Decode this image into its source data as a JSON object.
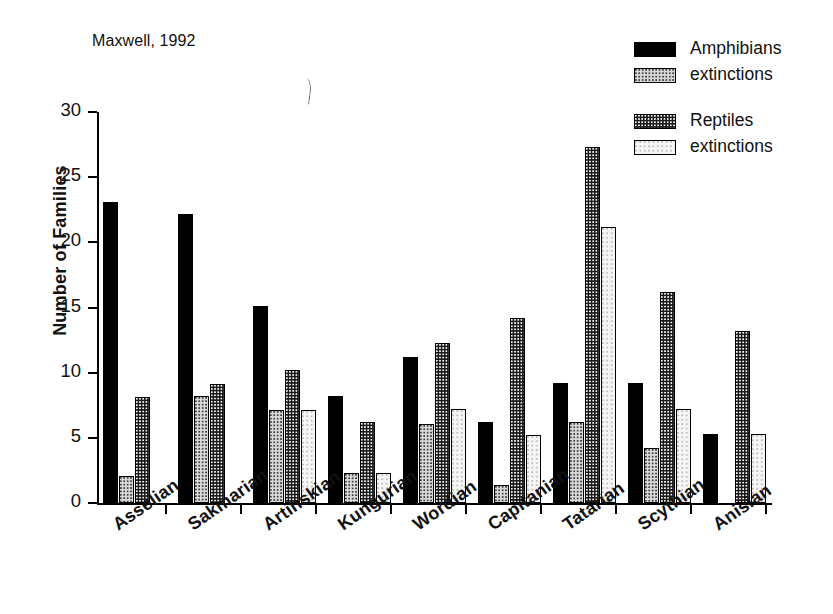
{
  "figure": {
    "source_caption": "Maxwell, 1992",
    "stray_mark_name": "scan-artifact"
  },
  "legend": {
    "groups": [
      {
        "entries": [
          {
            "label": "Amphibians",
            "swatch": "solid",
            "color": "#000000"
          },
          {
            "label": "extinctions",
            "swatch": "light",
            "color": "#d8d8d8"
          }
        ]
      },
      {
        "entries": [
          {
            "label": "Reptiles",
            "swatch": "dark",
            "color": "#1b1b1b"
          },
          {
            "label": "extinctions",
            "swatch": "white",
            "color": "#f5f5f5"
          }
        ]
      }
    ]
  },
  "chart_data": {
    "type": "bar",
    "title": "",
    "annotation": "Maxwell, 1992",
    "xlabel": "",
    "ylabel": "Number of Families",
    "ylim": [
      0,
      30
    ],
    "yticks": [
      0,
      5,
      10,
      15,
      20,
      25,
      30
    ],
    "grid": false,
    "legend_position": "top-right",
    "categories": [
      "Asselian",
      "Sakmarian",
      "Artinskian",
      "Kungurian",
      "Wordian",
      "Capitanian",
      "Tatarian",
      "Scythian",
      "Anisian"
    ],
    "series": [
      {
        "name": "Amphibians",
        "fill": "solid",
        "values": [
          23.1,
          22.2,
          15.1,
          8.2,
          11.2,
          6.2,
          9.2,
          9.2,
          5.3
        ]
      },
      {
        "name": "Amphibian extinctions",
        "fill": "light",
        "values": [
          2.1,
          8.2,
          7.1,
          2.3,
          6.1,
          1.4,
          6.2,
          4.2,
          0
        ]
      },
      {
        "name": "Reptiles",
        "fill": "dark",
        "values": [
          8.1,
          9.1,
          10.2,
          6.2,
          12.3,
          14.2,
          27.3,
          16.2,
          13.2
        ]
      },
      {
        "name": "Reptile extinctions",
        "fill": "white",
        "values": [
          0,
          0,
          7.1,
          2.3,
          7.2,
          5.2,
          21.2,
          7.2,
          5.3
        ]
      }
    ]
  }
}
